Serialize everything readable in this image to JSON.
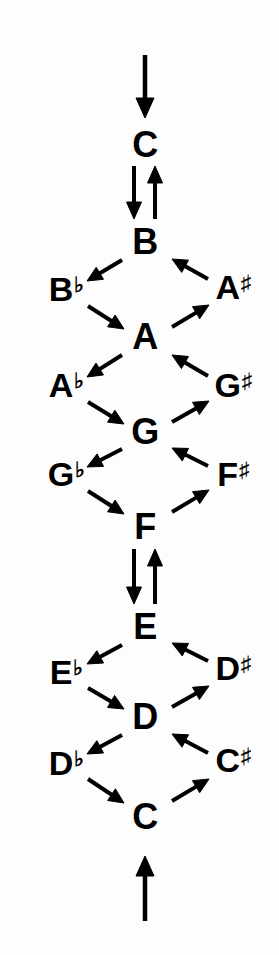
{
  "diagram": {
    "type": "music-theory-diagram",
    "ink_color": "#000000",
    "background_color": "#fdfdfd",
    "center_notes": [
      {
        "id": "c-top",
        "label": "C",
        "base": "C",
        "accidental": "",
        "x": 145,
        "y": 145
      },
      {
        "id": "b",
        "label": "B",
        "base": "B",
        "accidental": "",
        "x": 145,
        "y": 242
      },
      {
        "id": "a",
        "label": "A",
        "base": "A",
        "accidental": "",
        "x": 145,
        "y": 337
      },
      {
        "id": "g",
        "label": "G",
        "base": "G",
        "accidental": "",
        "x": 145,
        "y": 432
      },
      {
        "id": "f",
        "label": "F",
        "base": "F",
        "accidental": "",
        "x": 145,
        "y": 527
      },
      {
        "id": "e",
        "label": "E",
        "base": "E",
        "accidental": "",
        "x": 145,
        "y": 627
      },
      {
        "id": "d",
        "label": "D",
        "base": "D",
        "accidental": "",
        "x": 145,
        "y": 717
      },
      {
        "id": "c-bottom",
        "label": "C",
        "base": "C",
        "accidental": "",
        "x": 145,
        "y": 817
      }
    ],
    "flat_notes": [
      {
        "id": "b-flat",
        "label": "B♭",
        "base": "B",
        "accidental": "♭",
        "x": 66,
        "y": 289
      },
      {
        "id": "a-flat",
        "label": "A♭",
        "base": "A",
        "accidental": "♭",
        "x": 66,
        "y": 385
      },
      {
        "id": "g-flat",
        "label": "G♭",
        "base": "G",
        "accidental": "♭",
        "x": 66,
        "y": 474
      },
      {
        "id": "e-flat",
        "label": "E♭",
        "base": "E",
        "accidental": "♭",
        "x": 66,
        "y": 672
      },
      {
        "id": "d-flat",
        "label": "D♭",
        "base": "D",
        "accidental": "♭",
        "x": 66,
        "y": 763
      }
    ],
    "sharp_notes": [
      {
        "id": "a-sharp",
        "label": "A♯",
        "base": "A",
        "accidental": "♯",
        "x": 233,
        "y": 287
      },
      {
        "id": "g-sharp",
        "label": "G♯",
        "base": "G",
        "accidental": "♯",
        "x": 233,
        "y": 385
      },
      {
        "id": "f-sharp",
        "label": "F♯",
        "base": "F",
        "accidental": "♯",
        "x": 233,
        "y": 474
      },
      {
        "id": "d-sharp",
        "label": "D♯",
        "base": "D",
        "accidental": "♯",
        "x": 233,
        "y": 668
      },
      {
        "id": "c-sharp",
        "label": "C♯",
        "base": "C",
        "accidental": "♯",
        "x": 233,
        "y": 760
      }
    ],
    "vertical_arrows": [
      {
        "id": "entry-arrow-top",
        "direction": "down",
        "x": 145,
        "y1": 55,
        "y2": 118
      },
      {
        "id": "c-to-b-down",
        "direction": "down",
        "x": 134,
        "y1": 166,
        "y2": 219
      },
      {
        "id": "b-to-c-up",
        "direction": "up",
        "x": 155,
        "y1": 219,
        "y2": 166
      },
      {
        "id": "f-to-e-down",
        "direction": "down",
        "x": 134,
        "y1": 549,
        "y2": 604
      },
      {
        "id": "e-to-f-up",
        "direction": "up",
        "x": 155,
        "y1": 604,
        "y2": 549
      },
      {
        "id": "entry-arrow-bottom",
        "direction": "up",
        "x": 145,
        "y1": 921,
        "y2": 856
      }
    ],
    "diagonal_arrows": [
      {
        "id": "b-to-bflat",
        "from": "B",
        "to": "B♭",
        "x1": 122,
        "y1": 260,
        "x2": 87,
        "y2": 281
      },
      {
        "id": "asharp-to-b",
        "from": "A♯",
        "to": "B",
        "x1": 208,
        "y1": 279,
        "x2": 172,
        "y2": 259
      },
      {
        "id": "bflat-to-a",
        "from": "B♭",
        "to": "A",
        "x1": 88,
        "y1": 306,
        "x2": 124,
        "y2": 329
      },
      {
        "id": "a-to-asharp",
        "from": "A",
        "to": "A♯",
        "x1": 172,
        "y1": 327,
        "x2": 209,
        "y2": 305
      },
      {
        "id": "a-to-aflat",
        "from": "A",
        "to": "A♭",
        "x1": 122,
        "y1": 355,
        "x2": 87,
        "y2": 377
      },
      {
        "id": "gsharp-to-a",
        "from": "G♯",
        "to": "A",
        "x1": 208,
        "y1": 376,
        "x2": 172,
        "y2": 355
      },
      {
        "id": "aflat-to-g",
        "from": "A♭",
        "to": "G",
        "x1": 88,
        "y1": 402,
        "x2": 124,
        "y2": 424
      },
      {
        "id": "g-to-gsharp",
        "from": "G",
        "to": "G♯",
        "x1": 172,
        "y1": 422,
        "x2": 209,
        "y2": 401
      },
      {
        "id": "g-to-gflat",
        "from": "G",
        "to": "G♭",
        "x1": 122,
        "y1": 449,
        "x2": 87,
        "y2": 467
      },
      {
        "id": "fsharp-to-g",
        "from": "F♯",
        "to": "G",
        "x1": 208,
        "y1": 466,
        "x2": 172,
        "y2": 448
      },
      {
        "id": "gflat-to-f",
        "from": "G♭",
        "to": "F",
        "x1": 88,
        "y1": 491,
        "x2": 124,
        "y2": 514
      },
      {
        "id": "f-to-fsharp",
        "from": "F",
        "to": "F♯",
        "x1": 172,
        "y1": 512,
        "x2": 209,
        "y2": 490
      },
      {
        "id": "e-to-eflat",
        "from": "E",
        "to": "E♭",
        "x1": 122,
        "y1": 645,
        "x2": 87,
        "y2": 664
      },
      {
        "id": "dsharp-to-e",
        "from": "D♯",
        "to": "E",
        "x1": 208,
        "y1": 661,
        "x2": 172,
        "y2": 643
      },
      {
        "id": "eflat-to-d",
        "from": "E♭",
        "to": "D",
        "x1": 88,
        "y1": 688,
        "x2": 124,
        "y2": 709
      },
      {
        "id": "d-to-dsharp",
        "from": "D",
        "to": "D♯",
        "x1": 172,
        "y1": 707,
        "x2": 209,
        "y2": 686
      },
      {
        "id": "d-to-dflat",
        "from": "D",
        "to": "D♭",
        "x1": 122,
        "y1": 735,
        "x2": 87,
        "y2": 754
      },
      {
        "id": "csharp-to-d",
        "from": "C♯",
        "to": "D",
        "x1": 208,
        "y1": 753,
        "x2": 172,
        "y2": 734
      },
      {
        "id": "dflat-to-c",
        "from": "D♭",
        "to": "C",
        "x1": 88,
        "y1": 779,
        "x2": 124,
        "y2": 803
      },
      {
        "id": "c-to-csharp",
        "from": "C",
        "to": "C♯",
        "x1": 172,
        "y1": 801,
        "x2": 209,
        "y2": 779
      }
    ]
  }
}
